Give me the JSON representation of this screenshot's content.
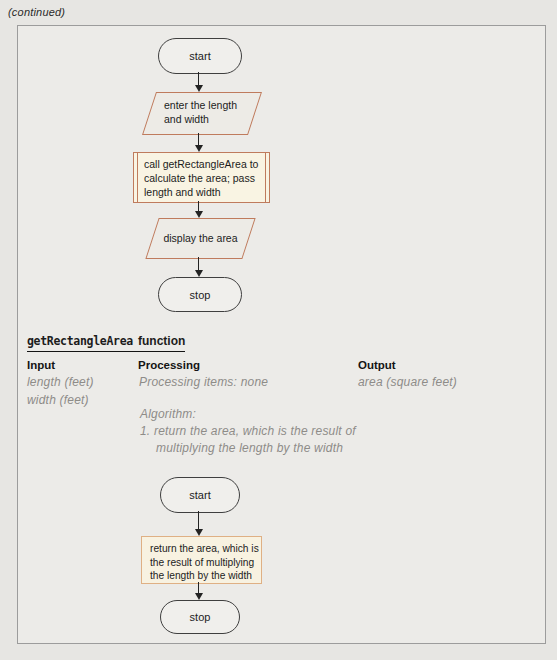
{
  "page": {
    "continued": "(continued)"
  },
  "colors": {
    "shape_accent_orange": "#bf7b5d",
    "return_box_accent_tan": "#dfb084",
    "handwriting_gray": "#8e8c88",
    "page_background": "#e7e6e3",
    "call_box_fill": "#f9f4e3"
  },
  "main_flowchart": {
    "start_label": "start",
    "input_step": "enter the length and width",
    "call_step": "call getRectangleArea to calculate the area; pass length and width",
    "display_step": "display the area",
    "stop_label": "stop"
  },
  "function_header": {
    "code_part": "getRectangleArea",
    "text_part": "function"
  },
  "ipo_chart": {
    "input": {
      "header": "Input",
      "items": [
        "length (feet)",
        "width (feet)"
      ]
    },
    "processing": {
      "header": "Processing",
      "items_line": "Processing items: none",
      "algorithm_label": "Algorithm:",
      "algorithm_lines": [
        "1. return the area, which is the result of",
        "multiplying the length by the width"
      ]
    },
    "output": {
      "header": "Output",
      "items": [
        "area (square feet)"
      ]
    }
  },
  "function_flowchart": {
    "start_label": "start",
    "return_step": "return the area, which is the result of multiplying the length by the width",
    "stop_label": "stop"
  }
}
